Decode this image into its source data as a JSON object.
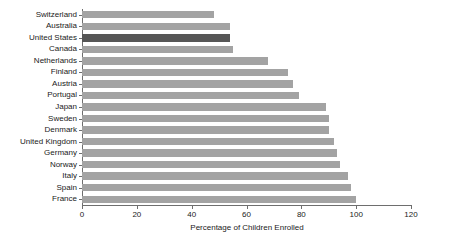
{
  "chart_data": {
    "type": "bar",
    "orientation": "horizontal",
    "title": "",
    "xlabel": "Percentage of Children Enrolled",
    "ylabel": "",
    "xlim": [
      0,
      120
    ],
    "xticks": [
      0,
      20,
      40,
      60,
      80,
      100,
      120
    ],
    "grid": false,
    "legend": null,
    "categories": [
      "Switzerland",
      "Australia",
      "United States",
      "Canada",
      "Netherlands",
      "Finland",
      "Austria",
      "Portugal",
      "Japan",
      "Sweden",
      "Denmark",
      "United Kingdom",
      "Germany",
      "Norway",
      "Italy",
      "Spain",
      "France"
    ],
    "values": [
      48,
      54,
      54,
      55,
      68,
      75,
      77,
      79,
      89,
      90,
      90,
      92,
      93,
      94,
      97,
      98,
      100
    ],
    "highlight_category": "United States",
    "colors": {
      "bar": "#a3a3a3",
      "bar_highlight": "#565656",
      "axis": "#6e6e6e",
      "text": "#1a1a1a",
      "background": "#ffffff"
    }
  }
}
